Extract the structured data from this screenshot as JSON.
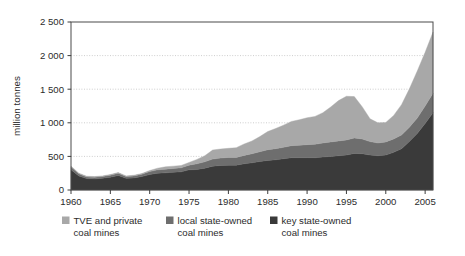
{
  "chart_data": {
    "type": "area",
    "title": "",
    "xlabel": "",
    "ylabel": "million tonnes",
    "xlim": [
      1960,
      2006
    ],
    "ylim": [
      0,
      2500
    ],
    "grid": true,
    "stacked": true,
    "legend_position": "bottom",
    "ytick_labels": [
      "2 500",
      "2 000",
      "1 500",
      "1 000",
      "500",
      "0"
    ],
    "ytick_values": [
      2500,
      2000,
      1500,
      1000,
      500,
      0
    ],
    "xtick_labels": [
      "1960",
      "1965",
      "1970",
      "1975",
      "1980",
      "1985",
      "1990",
      "1995",
      "2000",
      "2005"
    ],
    "xtick_values": [
      1960,
      1965,
      1970,
      1975,
      1980,
      1985,
      1990,
      1995,
      2000,
      2005
    ],
    "x": [
      1960,
      1961,
      1962,
      1963,
      1964,
      1965,
      1966,
      1967,
      1968,
      1969,
      1970,
      1971,
      1972,
      1973,
      1974,
      1975,
      1976,
      1977,
      1978,
      1979,
      1980,
      1981,
      1982,
      1983,
      1984,
      1985,
      1986,
      1987,
      1988,
      1989,
      1990,
      1991,
      1992,
      1993,
      1994,
      1995,
      1996,
      1997,
      1998,
      1999,
      2000,
      2001,
      2002,
      2003,
      2004,
      2005,
      2006
    ],
    "series": [
      {
        "name": "key state-owned coal mines",
        "color": "#3a3a3a",
        "values": [
          300,
          210,
          170,
          165,
          175,
          190,
          215,
          175,
          180,
          200,
          230,
          250,
          255,
          265,
          270,
          300,
          305,
          325,
          355,
          365,
          370,
          370,
          390,
          405,
          425,
          440,
          450,
          465,
          480,
          480,
          480,
          480,
          490,
          500,
          510,
          520,
          545,
          540,
          520,
          510,
          520,
          560,
          615,
          720,
          840,
          990,
          1150
        ]
      },
      {
        "name": "local state-owned coal mines",
        "color": "#6e6e6e",
        "values": [
          45,
          30,
          25,
          25,
          25,
          30,
          35,
          25,
          30,
          35,
          45,
          50,
          55,
          55,
          60,
          70,
          85,
          95,
          105,
          110,
          115,
          115,
          125,
          135,
          145,
          160,
          165,
          170,
          180,
          185,
          195,
          200,
          210,
          215,
          220,
          225,
          230,
          220,
          200,
          190,
          195,
          200,
          205,
          215,
          230,
          260,
          290
        ]
      },
      {
        "name": "TVE and private coal mines",
        "color": "#a8a8a8",
        "values": [
          10,
          10,
          10,
          10,
          10,
          10,
          10,
          10,
          10,
          10,
          15,
          25,
          35,
          35,
          35,
          40,
          65,
          90,
          135,
          135,
          135,
          145,
          170,
          190,
          225,
          270,
          300,
          330,
          360,
          380,
          400,
          415,
          450,
          520,
          600,
          650,
          615,
          480,
          340,
          300,
          290,
          350,
          450,
          570,
          700,
          800,
          910
        ]
      }
    ]
  },
  "legend": {
    "items": [
      {
        "label_line1": "TVE and private",
        "label_line2": "coal mines",
        "color": "#a8a8a8"
      },
      {
        "label_line1": "local state-owned",
        "label_line2": "coal mines",
        "color": "#6e6e6e"
      },
      {
        "label_line1": "key state-owned",
        "label_line2": "coal mines",
        "color": "#3a3a3a"
      }
    ]
  }
}
